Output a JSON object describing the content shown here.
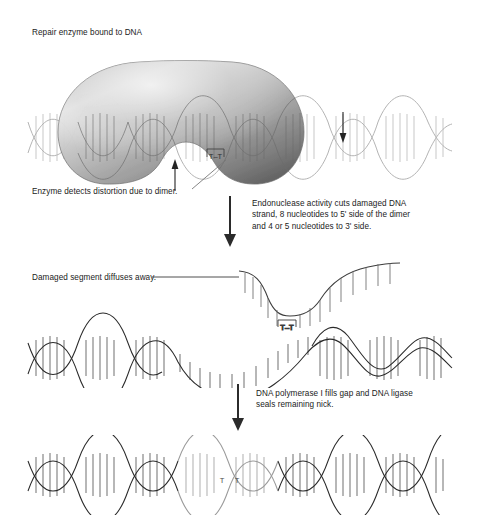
{
  "figure": {
    "title_label": "Repair enzyme bound to DNA",
    "topic": "nucleotide-excision-repair-of-thymine-dimer"
  },
  "stages": [
    {
      "id": "stage-1-enzyme-bound",
      "label": "Repair enzyme bound to DNA",
      "callout": "Enzyme detects distortion due to dimer.",
      "dimer_label": "T–T"
    },
    {
      "id": "stage-2-excision",
      "callout": "Damaged segment diffuses away.",
      "dimer_label": "T–T"
    },
    {
      "id": "stage-3-repaired",
      "dimer_label_left": "T",
      "dimer_label_right": "T"
    }
  ],
  "step_arrows": [
    {
      "id": "step-arrow-endonuclease",
      "text": "Endonuclease activity cuts damaged DNA strand, 8 nucleotides to 5' side of the dimer and 4 or 5 nucleotides to 3' side.",
      "lines": [
        "Endonuclease activity cuts damaged DNA",
        "strand, 8 nucleotides to 5' side of the dimer",
        "and 4 or 5 nucleotides to 3' side."
      ]
    },
    {
      "id": "step-arrow-polymerase",
      "text": "DNA polymerase I fills gap and DNA ligase seals remaining nick.",
      "lines": [
        "DNA polymerase I fills gap and DNA ligase",
        "seals remaining nick."
      ]
    }
  ],
  "labels": {
    "top_title": "Repair enzyme bound to DNA",
    "enzyme_detects": "Enzyme detects distortion due to dimer.",
    "damaged_diffuses": "Damaged segment diffuses away.",
    "endo_line1": "Endonuclease activity cuts damaged DNA",
    "endo_line2": "strand, 8 nucleotides to 5' side of the dimer",
    "endo_line3": "and 4 or 5 nucleotides to 3' side.",
    "poly_line1": "DNA polymerase I fills gap and DNA ligase",
    "poly_line2": "seals remaining nick.",
    "dimer_top": "T–T",
    "dimer_mid": "T–T",
    "dimer_bottom_left": "T",
    "dimer_bottom_right": "T"
  },
  "colors": {
    "background": "#ffffff",
    "text": "#1b1b1b",
    "dna_dark": "#222222",
    "dna_light": "#b9b9b9",
    "dna_mid": "#8d8d8d",
    "enzyme_light": "#e2e2e2",
    "enzyme_mid": "#9c9c9c",
    "enzyme_dark": "#5d5d5d",
    "arrow": "#2b2b2b",
    "leader_line": "#6b6b6b"
  }
}
